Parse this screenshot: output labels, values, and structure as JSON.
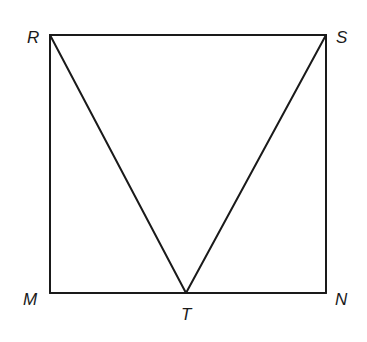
{
  "diagram": {
    "type": "geometry",
    "points": {
      "R": {
        "label": "R",
        "x": 50,
        "y": 35
      },
      "S": {
        "label": "S",
        "x": 326,
        "y": 35
      },
      "M": {
        "label": "M",
        "x": 50,
        "y": 293
      },
      "N": {
        "label": "N",
        "x": 326,
        "y": 293
      },
      "T": {
        "label": "T",
        "x": 186,
        "y": 293
      }
    },
    "segments": [
      "RS",
      "SN",
      "NM",
      "MR",
      "RT",
      "ST"
    ],
    "shapes": [
      "rectangle RSNM",
      "triangle RST"
    ]
  }
}
